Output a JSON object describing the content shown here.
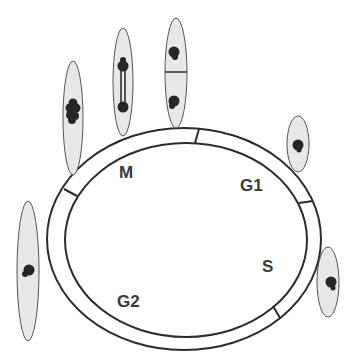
{
  "diagram": {
    "phases": [
      {
        "id": "M",
        "label": "M"
      },
      {
        "id": "G1",
        "label": "G1"
      },
      {
        "id": "S",
        "label": "S"
      },
      {
        "id": "G2",
        "label": "G2"
      }
    ],
    "cells": [
      {
        "id": "cell-g2-left",
        "stage": "G2 nucleus"
      },
      {
        "id": "cell-metaphase",
        "stage": "metaphase"
      },
      {
        "id": "cell-anaphase",
        "stage": "anaphase"
      },
      {
        "id": "cell-cytokinesis",
        "stage": "cytokinesis"
      },
      {
        "id": "cell-g1",
        "stage": "G1 nucleus"
      },
      {
        "id": "cell-s",
        "stage": "S nucleus"
      }
    ],
    "colors": {
      "stroke": "#2b2b2b",
      "cell_fill": "#e8e8e8",
      "nucleus": "#262626",
      "label": "#3a3a3a"
    }
  }
}
